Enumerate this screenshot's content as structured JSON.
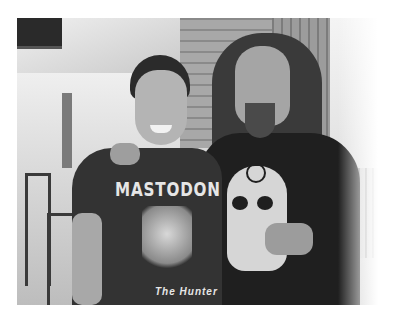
{
  "image": {
    "description": "Black-and-white photo of two smiling men posing together in a restaurant/patio setting",
    "style": "grayscale",
    "people": [
      {
        "position": "left",
        "shirt_text": "MASTODON",
        "shirt_subtext": "The Hunter"
      },
      {
        "position": "right",
        "shirt_graphic": "skull with crosshair target"
      }
    ]
  }
}
